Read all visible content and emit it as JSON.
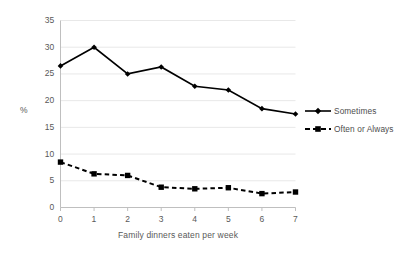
{
  "chart_data": {
    "type": "line",
    "title": "",
    "xlabel": "Family dinners eaten per week",
    "ylabel": "%",
    "x": [
      0,
      1,
      2,
      3,
      4,
      5,
      6,
      7
    ],
    "categories": [
      "0",
      "1",
      "2",
      "3",
      "4",
      "5",
      "6",
      "7"
    ],
    "xlim": [
      0,
      7
    ],
    "ylim": [
      0,
      35
    ],
    "yticks": [
      0,
      5,
      10,
      15,
      20,
      25,
      30,
      35
    ],
    "ytick_labels": [
      "0",
      "5",
      "10",
      "15",
      "20",
      "25",
      "30",
      "35"
    ],
    "xtick_labels": [
      "0",
      "1",
      "2",
      "3",
      "4",
      "5",
      "6",
      "7"
    ],
    "grid": "horizontal",
    "grid_color": "#e8e8e8",
    "legend_position": "right",
    "series": [
      {
        "name": "Sometimes",
        "values": [
          26.5,
          30.0,
          25.0,
          26.3,
          22.7,
          22.0,
          18.5,
          17.5
        ],
        "line_style": "solid",
        "marker": "diamond",
        "color": "#000000"
      },
      {
        "name": "Often or Always",
        "values": [
          8.5,
          6.3,
          6.0,
          3.8,
          3.5,
          3.7,
          2.6,
          2.9
        ],
        "line_style": "dashed",
        "marker": "square",
        "color": "#000000"
      }
    ]
  },
  "axes": {
    "y_title": "%",
    "x_title": "Family dinners eaten per week"
  },
  "legend": {
    "items": [
      {
        "label": "Sometimes"
      },
      {
        "label": "Often or Always"
      }
    ]
  }
}
